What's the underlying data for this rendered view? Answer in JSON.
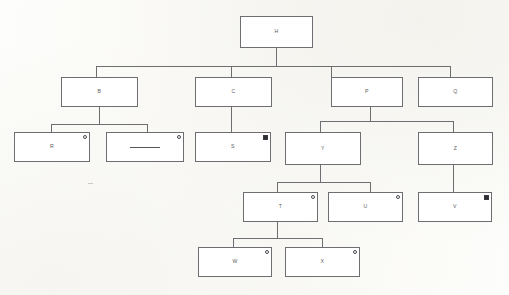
{
  "diagram": {
    "type": "tree-diagram",
    "background_color": "#fdfdfb",
    "box_border_color": "#6e6e72",
    "label_color": "#5c5c60",
    "marker_fill_color": "#2f2f33",
    "levels": 5,
    "node_count": 15,
    "nodes": [
      {
        "id": "H",
        "label": "H",
        "level": 1,
        "marker": "none",
        "parent": null
      },
      {
        "id": "B",
        "label": "B",
        "level": 2,
        "marker": "none",
        "parent": "H"
      },
      {
        "id": "C",
        "label": "C",
        "level": 2,
        "marker": "none",
        "parent": "H"
      },
      {
        "id": "P",
        "label": "P",
        "level": 2,
        "marker": "none",
        "parent": "H"
      },
      {
        "id": "Q",
        "label": "Q",
        "level": 2,
        "marker": "none",
        "parent": "H"
      },
      {
        "id": "R",
        "label": "R",
        "level": 3,
        "marker": "circle",
        "parent": "B"
      },
      {
        "id": "DASH",
        "label": "—",
        "level": 3,
        "marker": "circle",
        "parent": "B"
      },
      {
        "id": "S",
        "label": "S",
        "level": 3,
        "marker": "square",
        "parent": "C"
      },
      {
        "id": "Y",
        "label": "Y",
        "level": 3,
        "marker": "none",
        "parent": "P"
      },
      {
        "id": "Z",
        "label": "Z",
        "level": 3,
        "marker": "none",
        "parent": "P"
      },
      {
        "id": "T",
        "label": "T",
        "level": 4,
        "marker": "circle",
        "parent": "Y"
      },
      {
        "id": "U",
        "label": "U",
        "level": 4,
        "marker": "circle",
        "parent": "Y"
      },
      {
        "id": "V",
        "label": "V",
        "level": 4,
        "marker": "square",
        "parent": "Z"
      },
      {
        "id": "W",
        "label": "W",
        "level": 5,
        "marker": "circle",
        "parent": "T"
      },
      {
        "id": "X",
        "label": "X",
        "level": 5,
        "marker": "circle",
        "parent": "T"
      }
    ],
    "legend": {
      "circle_marker_name": "hollow-circle-marker",
      "square_marker_name": "filled-square-marker"
    }
  }
}
